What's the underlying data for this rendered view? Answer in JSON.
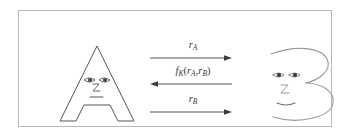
{
  "figure": {
    "caption": "",
    "frame": {
      "border_color": "#b9b9b9",
      "background": "#ffffff"
    },
    "line_color": "#555555",
    "text_color": "#3a3a3a"
  },
  "parties": [
    {
      "id": "party-a",
      "label": "A",
      "name": "letter-a-character",
      "description": "Outlined capital letter A with a cartoon face",
      "face_parts": [
        "left-eye",
        "right-eye",
        "nose",
        "mouth"
      ]
    },
    {
      "id": "party-b",
      "label": "B",
      "name": "letter-b-character",
      "description": "Outlined capital letter B drawn as a face profile",
      "face_parts": [
        "left-eye",
        "right-eye",
        "nose",
        "mouth"
      ]
    }
  ],
  "flows": [
    {
      "id": "flow-ra",
      "direction": "right",
      "label_plain": "r_A",
      "label_base": "r",
      "label_sub": "A"
    },
    {
      "id": "flow-fk",
      "direction": "left",
      "label_plain": "f_K(r_A, r_B)",
      "label_f": "f",
      "label_f_sub": "K",
      "label_open": "(",
      "label_arg1_base": "r",
      "label_arg1_sub": "A",
      "label_comma": ",",
      "label_arg2_base": "r",
      "label_arg2_sub": "B",
      "label_close": ")"
    },
    {
      "id": "flow-rb",
      "direction": "right",
      "label_plain": "r_B",
      "label_base": "r",
      "label_sub": "B"
    }
  ]
}
